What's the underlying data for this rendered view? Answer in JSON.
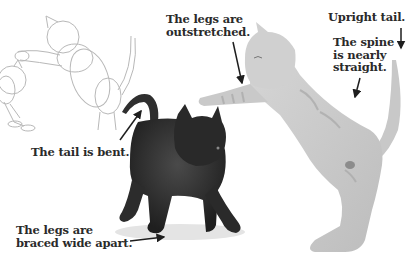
{
  "illustration": {
    "subject": "Two kittens playing: pencil sketch construction, black kitten, tabby kitten",
    "figures": [
      {
        "name": "construction-sketch",
        "description": "light pencil circle-and-oval construction lines of two cats"
      },
      {
        "name": "black-kitten",
        "description": "dark kitten with bent tail and legs braced wide"
      },
      {
        "name": "tabby-kitten",
        "description": "light grey striped kitten standing on hind legs, paw outstretched, upright tail"
      }
    ]
  },
  "annotations": [
    {
      "id": "legs-outstretched",
      "lines": [
        "The legs are",
        "outstretched."
      ]
    },
    {
      "id": "upright-tail",
      "lines": [
        "Upright tail."
      ]
    },
    {
      "id": "spine-straight",
      "lines": [
        "The spine",
        "is nearly",
        "straight."
      ]
    },
    {
      "id": "tail-bent",
      "lines": [
        "The tail is bent."
      ]
    },
    {
      "id": "legs-braced",
      "lines": [
        "The legs are",
        "braced wide apart."
      ]
    }
  ],
  "colors": {
    "background": "#ffffff",
    "text": "#2a2a2a",
    "arrow": "#1e1e1e",
    "sketch": "#b8b8b8",
    "black_kitten": "#2e2e2e",
    "tabby_kitten": "#cfcfcf"
  }
}
